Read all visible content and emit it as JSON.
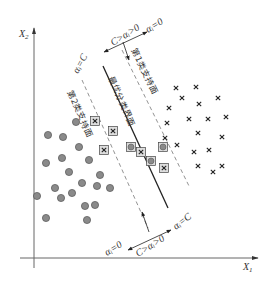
{
  "diagram": {
    "axes": {
      "x_label": "X",
      "x_sub": "1",
      "y_label": "X",
      "y_sub": "2"
    },
    "planes": {
      "optimal": "最优分类界面",
      "class1_support": "第1类支持面",
      "class2_support": "第2类支持面"
    },
    "alpha_labels": {
      "top_right": "αᵢ=0",
      "top_middle": "C>αᵢ>0",
      "top_left": "αᵢ=C",
      "bottom_right": "αᵢ=C",
      "bottom_middle": "C>αᵢ>0",
      "bottom_left": "αᵢ=0"
    },
    "colors": {
      "circle_fill": "#8a8a8a",
      "circle_stroke": "#555555",
      "line": "#222222",
      "dashed": "#777777",
      "axis": "#666666"
    },
    "class2_circles": [
      [
        76,
        122
      ],
      [
        48,
        135
      ],
      [
        63,
        137
      ],
      [
        79,
        147
      ],
      [
        46,
        163
      ],
      [
        62,
        158
      ],
      [
        89,
        160
      ],
      [
        69,
        172
      ],
      [
        100,
        175
      ],
      [
        55,
        188
      ],
      [
        82,
        183
      ],
      [
        97,
        186
      ],
      [
        110,
        188
      ],
      [
        37,
        196
      ],
      [
        61,
        198
      ],
      [
        72,
        193
      ],
      [
        85,
        206
      ],
      [
        95,
        205
      ],
      [
        46,
        218
      ],
      [
        87,
        220
      ]
    ],
    "class2_sv_circles": [
      [
        131,
        147
      ],
      [
        163,
        147
      ],
      [
        151,
        161
      ]
    ],
    "class1_crosses": [
      [
        176,
        88
      ],
      [
        196,
        87
      ],
      [
        182,
        98
      ],
      [
        218,
        98
      ],
      [
        199,
        104
      ],
      [
        169,
        108
      ],
      [
        189,
        119
      ],
      [
        208,
        119
      ],
      [
        226,
        117
      ],
      [
        167,
        123
      ],
      [
        198,
        133
      ],
      [
        222,
        137
      ],
      [
        165,
        138
      ],
      [
        177,
        145
      ],
      [
        209,
        150
      ],
      [
        194,
        152
      ],
      [
        198,
        166
      ],
      [
        222,
        166
      ],
      [
        213,
        172
      ]
    ],
    "class1_sv_crosses": [
      [
        95,
        121
      ],
      [
        113,
        131
      ],
      [
        104,
        150
      ],
      [
        141,
        152
      ],
      [
        164,
        168
      ]
    ]
  }
}
